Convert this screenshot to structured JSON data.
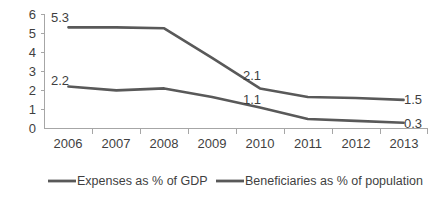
{
  "chart_data": {
    "type": "line",
    "title": "",
    "subtitle": "",
    "xlabel": "",
    "ylabel": "",
    "categories": [
      "2006",
      "2007",
      "2008",
      "2009",
      "2010",
      "2011",
      "2012",
      "2013"
    ],
    "series": [
      {
        "name": "Expenses as % of GDP",
        "color": "#595959",
        "values": [
          5.3,
          5.3,
          5.25,
          3.7,
          2.1,
          1.65,
          1.6,
          1.5
        ]
      },
      {
        "name": "Beneficiaries as % of population",
        "color": "#595959",
        "values": [
          2.2,
          2.0,
          2.1,
          1.65,
          1.1,
          0.5,
          0.4,
          0.3
        ]
      }
    ],
    "ylim": [
      0,
      6
    ],
    "y_ticks": [
      "0",
      "1",
      "2",
      "3",
      "4",
      "5",
      "6"
    ],
    "grid": false,
    "legend_position": "bottom",
    "annotations": [
      {
        "text": "5.3",
        "series": "Expenses as % of GDP",
        "category": "2006",
        "value": 5.3
      },
      {
        "text": "2.2",
        "series": "Beneficiaries as % of population",
        "category": "2006",
        "value": 2.2
      },
      {
        "text": "2.1",
        "series": "Expenses as % of GDP",
        "category": "2010",
        "value": 2.1
      },
      {
        "text": "1.1",
        "series": "Beneficiaries as % of population",
        "category": "2010",
        "value": 1.1
      },
      {
        "text": "1.5",
        "series": "Expenses as % of GDP",
        "category": "2013",
        "value": 1.5
      },
      {
        "text": "0.3",
        "series": "Beneficiaries as % of population",
        "category": "2013",
        "value": 0.3
      }
    ]
  },
  "axis": {
    "y_ticks": [
      "6",
      "5",
      "4",
      "3",
      "2",
      "1",
      "0"
    ],
    "x_ticks": [
      "2006",
      "2007",
      "2008",
      "2009",
      "2010",
      "2011",
      "2012",
      "2013"
    ],
    "line_color": "#a6a6a6"
  },
  "legend": {
    "items": [
      {
        "label": "Expenses as % of GDP",
        "color": "#595959"
      },
      {
        "label": "Beneficiaries as % of population",
        "color": "#595959"
      }
    ]
  },
  "labels": {
    "expenses_start": "5.3",
    "beneficiaries_start": "2.2",
    "expenses_mid": "2.1",
    "beneficiaries_mid": "1.1",
    "expenses_end": "1.5",
    "beneficiaries_end": "0.3"
  }
}
